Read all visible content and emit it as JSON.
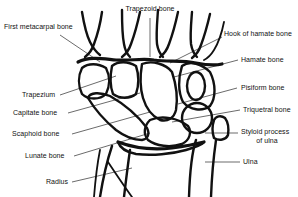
{
  "figure": {
    "background_color": "#ffffff",
    "line_color": "#111111",
    "leader_color": "#2b2b2b",
    "width": 298,
    "height": 197
  },
  "labels": {
    "first_metacarpal": "First metacarpal bone",
    "trapezoid": "Trapezoid bone",
    "hook_of_hamate": "Hook of hamate bone",
    "hamate": "Hamate bone",
    "pisiform": "Pisiform bone",
    "triquetral": "Triquetral bone",
    "styloid_line1": "Styloid process",
    "styloid_line2": "of ulna",
    "ulna": "Ulna",
    "trapezium": "Trapezium",
    "capitate": "Capitate bone",
    "scaphoid": "Scaphoid bone",
    "lunate": "Lunate bone",
    "radius": "Radius"
  }
}
